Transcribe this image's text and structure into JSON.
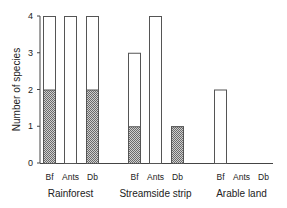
{
  "chart_data": {
    "type": "bar",
    "title": "",
    "xlabel": "",
    "ylabel": "Number of species",
    "ylim": [
      0,
      4
    ],
    "yticks": [
      0,
      1,
      2,
      3,
      4
    ],
    "grid": false,
    "legend": null,
    "groups": [
      "Rainforest",
      "Streamside strip",
      "Arable land"
    ],
    "categories": [
      "Bf",
      "Ants",
      "Db"
    ],
    "series": [
      {
        "name": "Total",
        "style": "open",
        "values": {
          "Rainforest": [
            4,
            4,
            4
          ],
          "Streamside strip": [
            3,
            4,
            1
          ],
          "Arable land": [
            2,
            0,
            0
          ]
        }
      },
      {
        "name": "Hatched portion",
        "style": "hatched",
        "values": {
          "Rainforest": [
            2,
            0,
            2
          ],
          "Streamside strip": [
            1,
            0,
            1
          ],
          "Arable land": [
            0,
            0,
            0
          ]
        }
      }
    ]
  },
  "labels": {
    "ylabel": "Number of species",
    "yticks": [
      "0",
      "1",
      "2",
      "3",
      "4"
    ],
    "groups": [
      "Rainforest",
      "Streamside strip",
      "Arable land"
    ],
    "cats": [
      "Bf",
      "Ants",
      "Db"
    ]
  },
  "colors": {
    "axis": "#444444",
    "bar_outline": "#555555",
    "hatch_dark": "#6a6a6a",
    "hatch_light": "#cfcfcf"
  }
}
